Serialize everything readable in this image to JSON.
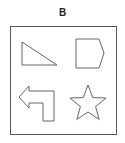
{
  "figure": {
    "label": "B",
    "box": {
      "x": 10,
      "y": 26,
      "width": 106,
      "height": 108,
      "stroke": "#555555"
    },
    "shapes": [
      {
        "name": "right-triangle",
        "points": "22,42 22,65 57,65"
      },
      {
        "name": "pentagon",
        "points": "76,39 99,39 104,53 99,68 76,68"
      },
      {
        "name": "bent-arrow-left",
        "points": "19,97 29,86 29,91 54,91 54,121 43,121 43,103 29,103 29,108"
      },
      {
        "name": "five-point-star",
        "center": [
          88,
          104
        ],
        "outer_radius": 19,
        "inner_radius": 8
      }
    ],
    "stroke_color": "#666666"
  }
}
